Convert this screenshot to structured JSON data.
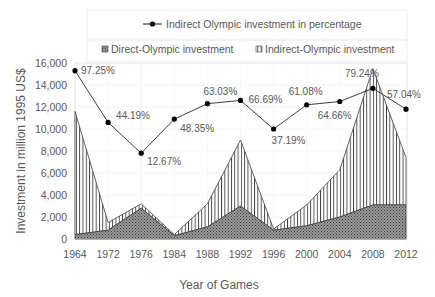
{
  "chart_data": {
    "type": "area",
    "title": "",
    "xlabel": "Year of Games",
    "ylabel": "Investment in million 1995 US$",
    "ylim": [
      0,
      16000
    ],
    "yticks": [
      0,
      2000,
      4000,
      6000,
      8000,
      10000,
      12000,
      14000,
      16000
    ],
    "ytick_labels": [
      "0",
      "2,000",
      "4,000",
      "6,000",
      "8,000",
      "10,000",
      "12,000",
      "14,000",
      "16,000"
    ],
    "categories": [
      "1964",
      "1972",
      "1976",
      "1984",
      "1988",
      "1992",
      "1996",
      "2000",
      "2004",
      "2008",
      "2012"
    ],
    "grid": true,
    "legend_position": "top",
    "series": [
      {
        "name": "Direct-Olympic investment",
        "kind": "stacked-area",
        "pattern": "dotted-crosshatch",
        "values": [
          400,
          800,
          2800,
          300,
          1100,
          3000,
          800,
          1200,
          2000,
          3100,
          3100
        ]
      },
      {
        "name": "Indirect-Olympic investment",
        "kind": "stacked-area",
        "pattern": "vertical-lines",
        "values": [
          11200,
          700,
          400,
          100,
          2100,
          6000,
          100,
          1900,
          4300,
          12400,
          4300
        ],
        "stack_total": [
          11600,
          1500,
          3200,
          400,
          3200,
          9000,
          900,
          3100,
          6300,
          15500,
          7400
        ]
      },
      {
        "name": "Indirect Olympic investment in percentage",
        "kind": "line",
        "marker": "circle",
        "plotted_values": [
          15300,
          10600,
          7800,
          10900,
          12300,
          12600,
          10000,
          12200,
          12500,
          13700,
          11800
        ],
        "data_labels": [
          "97.25%",
          "44.19%",
          "12.67%",
          "48.35%",
          "63.03%",
          "66.69%",
          "37.19%",
          "61.08%",
          "64.66%",
          "79.24%",
          "57.04%"
        ],
        "values_percent": [
          97.25,
          44.19,
          12.67,
          48.35,
          63.03,
          66.69,
          37.19,
          61.08,
          64.66,
          79.24,
          57.04
        ]
      }
    ]
  },
  "legend": {
    "line_label": "Indirect Olympic investment in percentage",
    "direct_label": "Direct-Olympic investment",
    "indirect_label": "Indirect-Olympic investment"
  },
  "colors": {
    "text": "#595959",
    "axis": "#bfbfbf",
    "line": "#404040",
    "marker": "#000000",
    "direct_fill": "#7f7f7f",
    "indirect_stroke": "#404040"
  }
}
